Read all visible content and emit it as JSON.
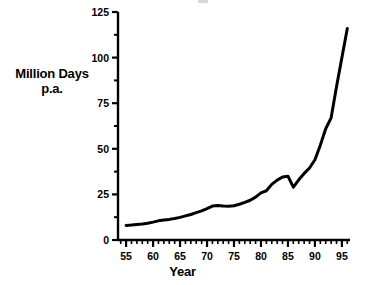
{
  "chart_data": {
    "type": "line",
    "title": "",
    "xlabel": "Year",
    "ylabel": "Million Days p.a.",
    "ylabel_lines": [
      "Million Days",
      "p.a."
    ],
    "xlim": [
      53.5,
      96.5
    ],
    "ylim": [
      0,
      125
    ],
    "grid": false,
    "legend": "none",
    "line_color": "#000000",
    "line_width": 3,
    "background_color": "#ffffff",
    "axis_color": "#000000",
    "x_ticks": [
      55,
      60,
      65,
      70,
      75,
      80,
      85,
      90,
      95
    ],
    "x_tick_labels": [
      "55",
      "60",
      "65",
      "70",
      "75",
      "80",
      "85",
      "90",
      "95"
    ],
    "x_minor_step": 1,
    "y_ticks": [
      0,
      25,
      50,
      75,
      100,
      125
    ],
    "y_tick_labels": [
      "0",
      "25",
      "50",
      "75",
      "100",
      "125"
    ],
    "y_minor_ticks": [
      12.5,
      37.5,
      62.5,
      87.5,
      112.5
    ],
    "x": [
      55,
      56,
      57,
      58,
      59,
      60,
      61,
      62,
      63,
      64,
      65,
      66,
      67,
      68,
      69,
      70,
      71,
      72,
      73,
      74,
      75,
      76,
      77,
      78,
      79,
      80,
      81,
      82,
      83,
      84,
      85,
      86,
      87,
      88,
      89,
      90,
      91,
      92,
      93,
      94,
      95,
      96
    ],
    "values": [
      8.0,
      8.2,
      8.5,
      8.8,
      9.2,
      9.8,
      10.5,
      11.0,
      11.3,
      11.8,
      12.4,
      13.2,
      14.0,
      15.0,
      16.0,
      17.2,
      18.6,
      18.9,
      18.6,
      18.5,
      18.8,
      19.6,
      20.6,
      21.8,
      23.5,
      25.8,
      27.0,
      30.5,
      32.8,
      34.5,
      35.0,
      29.0,
      33.0,
      36.5,
      39.5,
      44.0,
      52.0,
      61.0,
      67.0,
      84.0,
      100.0,
      116.0
    ],
    "series_name": "Million Days p.a."
  }
}
